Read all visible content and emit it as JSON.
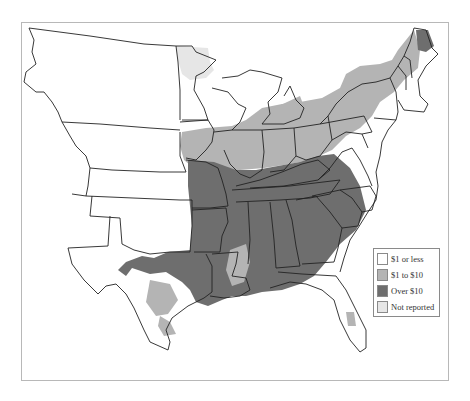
{
  "map": {
    "subject": "United States east of the Rockies, shaded by county",
    "legend": {
      "items": [
        {
          "label": "$1 or less",
          "color": "#ffffff",
          "key": "low"
        },
        {
          "label": "$1 to $10",
          "color": "#b4b4b4",
          "key": "mid"
        },
        {
          "label": "Over $10",
          "color": "#6e6e6e",
          "key": "high"
        },
        {
          "label": "Not reported",
          "color": "#e6e6e6",
          "key": "none"
        }
      ]
    },
    "regions": [
      {
        "name": "Missouri/Arkansas",
        "category": "high"
      },
      {
        "name": "Tennessee/Kentucky",
        "category": "high"
      },
      {
        "name": "Mississippi/Alabama/Georgia",
        "category": "high"
      },
      {
        "name": "Virginia/North Carolina/South Carolina",
        "category": "high"
      },
      {
        "name": "East Texas/Louisiana",
        "category": "high"
      },
      {
        "name": "Northern Maine",
        "category": "high"
      },
      {
        "name": "Iowa/Illinois/Indiana/Ohio",
        "category": "mid"
      },
      {
        "name": "Pennsylvania/New York/New England",
        "category": "mid"
      },
      {
        "name": "Michigan lower peninsula",
        "category": "mid"
      },
      {
        "name": "Minnesota",
        "category": "none"
      },
      {
        "name": "Plains and Western territories",
        "category": "low"
      },
      {
        "name": "Florida",
        "category": "low"
      }
    ]
  }
}
